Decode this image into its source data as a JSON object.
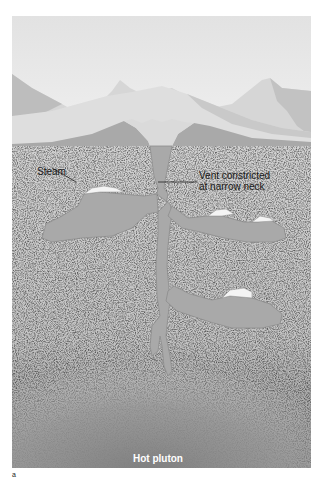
{
  "figure": {
    "labels": {
      "steam": "Steam",
      "vent_line1": "Vent constricted",
      "vent_line2": "at narrow neck",
      "pluton": "Hot pluton"
    },
    "figure_mark": "a",
    "colors": {
      "sky": "#e9e9e9",
      "mountain_light": "#dcdcdc",
      "mountain_shadow": "#bdbdbd",
      "cone": "#a9a9a9",
      "rock": "#cfcfcf",
      "water": "#a7a7a7",
      "steam": "#f2f2f2",
      "pluton": "#8a8a8a"
    }
  }
}
